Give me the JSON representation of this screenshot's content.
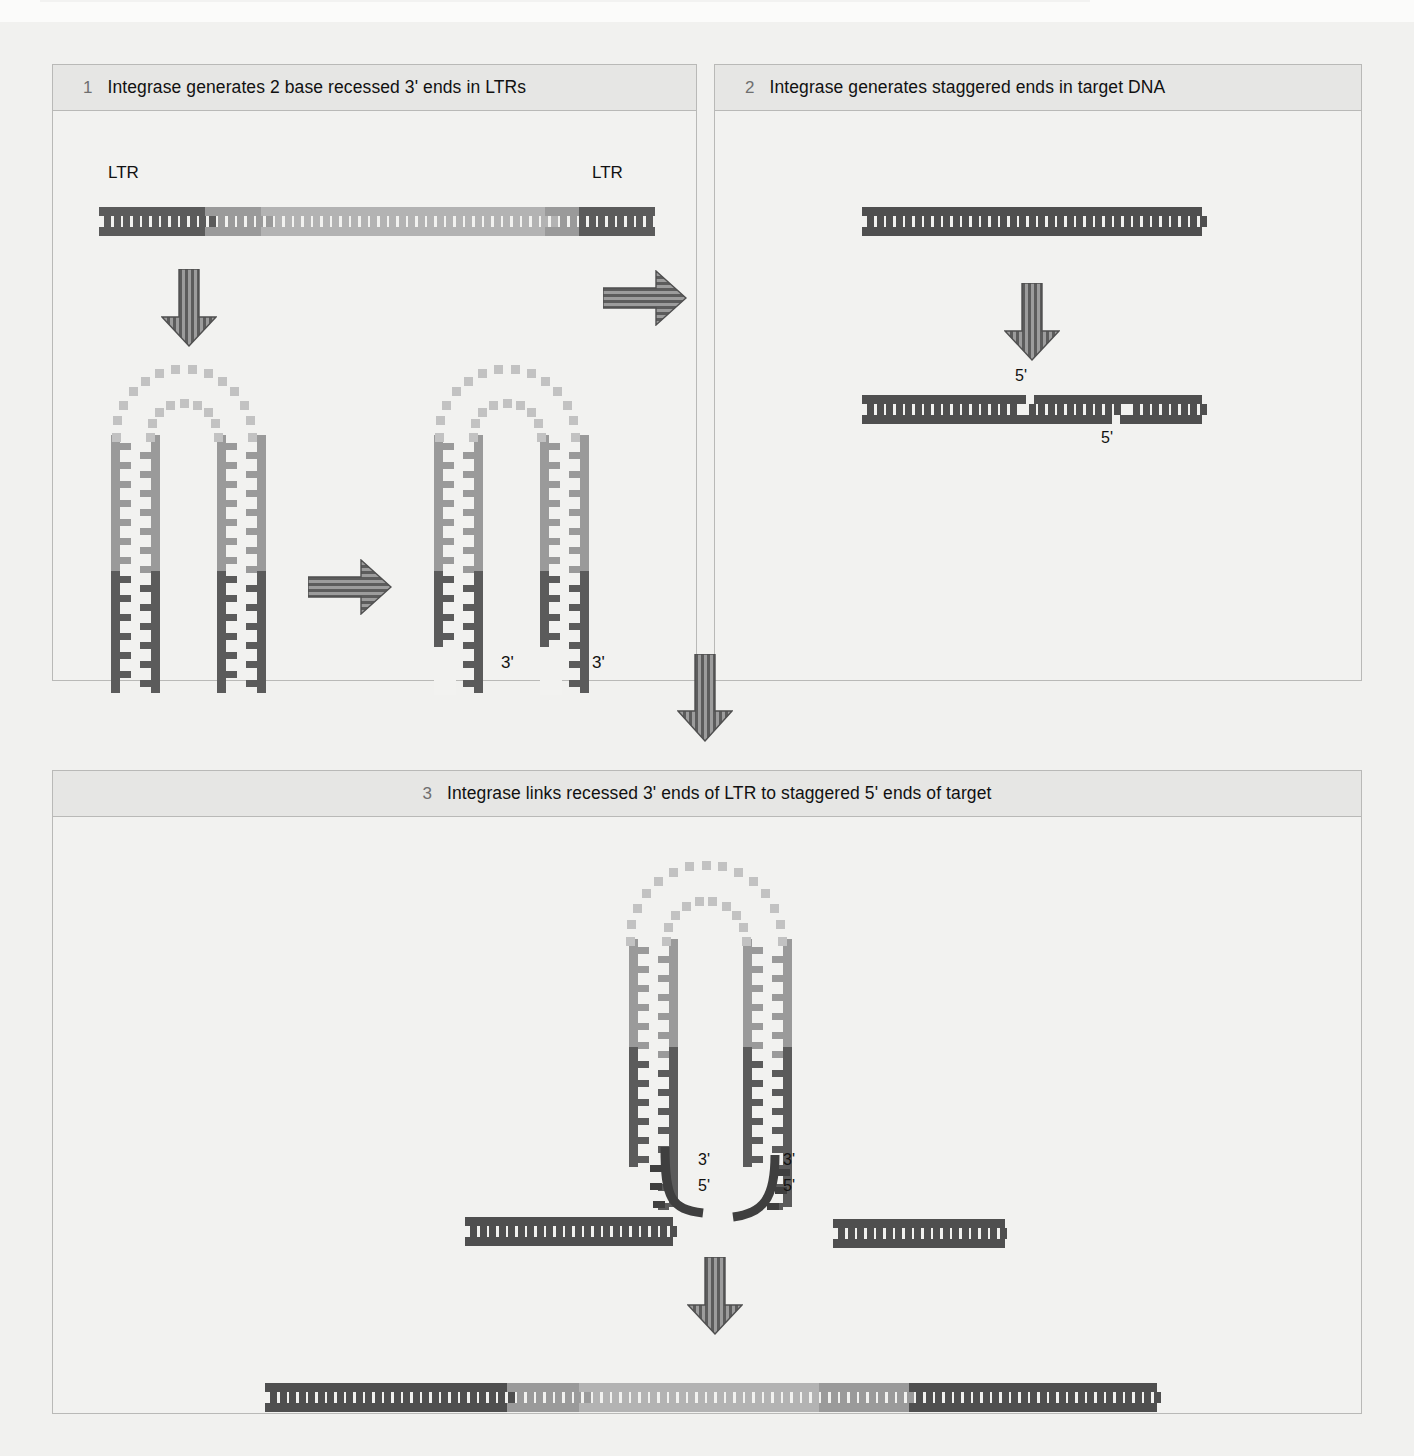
{
  "figure": {
    "title_visible": false,
    "background": "#f1f1ef",
    "panel_border": "#b9b9b7"
  },
  "colors": {
    "ltr_dark": "#5b5b5b",
    "viral_light": "#b3b3b3",
    "viral_mid": "#9a9a9a",
    "target_dark": "#4f4f4f",
    "loop_dot": "#c2c2c2",
    "arrow_fill": "#8e8e8e",
    "arrow_stroke": "#4f4f4f",
    "panel_head_bg": "#e6e6e4",
    "text": "#111111",
    "step_number": "#6f6f6f"
  },
  "panels": [
    {
      "id": "panel-1",
      "number": "1",
      "title": "Integrase generates 2 base recessed 3' ends in LTRs",
      "labels": {
        "ltr_left": "LTR",
        "ltr_right": "LTR",
        "three_prime_left": "3'",
        "three_prime_right": "3'"
      }
    },
    {
      "id": "panel-2",
      "number": "2",
      "title": "Integrase generates staggered ends in target DNA",
      "labels": {
        "five_prime_top": "5'",
        "five_prime_bottom": "5'"
      }
    },
    {
      "id": "panel-3",
      "number": "3",
      "title": "Integrase links recessed 3' ends of LTR to staggered 5' ends of target",
      "labels": {
        "three_prime_left": "3'",
        "five_prime_left": "5'",
        "three_prime_right": "3'",
        "five_prime_right": "5'"
      }
    }
  ],
  "arrows": [
    {
      "name": "panel1-down-arrow-1",
      "direction": "down",
      "pattern": "vertical-stripes"
    },
    {
      "name": "panel1-right-arrow",
      "direction": "right",
      "pattern": "horizontal-stripes"
    },
    {
      "name": "panel1-to-panel2-right-arrow",
      "direction": "right",
      "pattern": "horizontal-stripes"
    },
    {
      "name": "panel2-down-arrow",
      "direction": "down",
      "pattern": "vertical-stripes"
    },
    {
      "name": "panels-to-panel3-down-arrow",
      "direction": "down",
      "pattern": "vertical-stripes"
    },
    {
      "name": "panel3-down-arrow",
      "direction": "down",
      "pattern": "vertical-stripes"
    }
  ],
  "chart_data": {
    "type": "diagram",
    "steps": [
      {
        "step": 1,
        "caption": "Integrase generates 2 base recessed 3' ends in LTRs",
        "elements": [
          "linear viral DNA duplex with dark LTR segments at both ends and light internal region",
          "hairpin-folded viral DNA with dotted loop",
          "hairpin viral DNA with recessed 3' ends labelled 3'"
        ]
      },
      {
        "step": 2,
        "caption": "Integrase generates staggered ends in target DNA",
        "elements": [
          "intact target DNA duplex",
          "target DNA with staggered cuts exposing 5' overhangs labelled 5'"
        ]
      },
      {
        "step": 3,
        "caption": "Integrase links recessed 3' ends of LTR to staggered 5' ends of target",
        "elements": [
          "hairpin viral DNA joined to target DNA half-sites, labelled 3' and 5'",
          "final integrated provirus duplex: dark target flanks, LTR segments, light internal viral region"
        ]
      }
    ]
  }
}
